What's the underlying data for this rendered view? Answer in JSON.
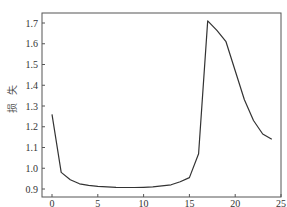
{
  "chart_data": {
    "type": "line",
    "title": "",
    "xlabel": "",
    "ylabel": "损 失",
    "xlim": [
      -1.2,
      25
    ],
    "ylim": [
      0.88,
      1.745
    ],
    "xticks": [
      0,
      5,
      10,
      15,
      20,
      25
    ],
    "xtick_labels": [
      "0",
      "5",
      "10",
      "15",
      "20",
      "25"
    ],
    "yticks": [
      0.9,
      1.0,
      1.1,
      1.2,
      1.3,
      1.4,
      1.5,
      1.6,
      1.7
    ],
    "ytick_labels": [
      "0.9",
      "1.0",
      "1.1",
      "1.2",
      "1.3",
      "1.4",
      "1.5",
      "1.6",
      "1.7"
    ],
    "grid": false,
    "legend": null,
    "series": [
      {
        "name": "loss",
        "color": "#333333",
        "x": [
          0,
          1,
          2,
          3,
          4,
          5,
          6,
          7,
          8,
          9,
          10,
          11,
          12,
          13,
          14,
          15,
          16,
          17,
          18,
          19,
          20,
          21,
          22,
          23,
          24
        ],
        "y": [
          1.26,
          0.98,
          0.945,
          0.925,
          0.918,
          0.913,
          0.91,
          0.908,
          0.907,
          0.907,
          0.908,
          0.91,
          0.915,
          0.92,
          0.935,
          0.955,
          1.07,
          1.71,
          1.665,
          1.61,
          1.47,
          1.33,
          1.23,
          1.165,
          1.14
        ]
      }
    ]
  }
}
